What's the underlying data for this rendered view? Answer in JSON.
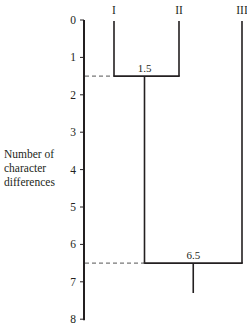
{
  "diagram": {
    "type": "dendrogram",
    "axis": {
      "label_lines": [
        "Number of",
        "character",
        "differences"
      ],
      "min": 0,
      "max": 8,
      "ticks": [
        0,
        1,
        2,
        3,
        4,
        5,
        6,
        7,
        8
      ]
    },
    "taxa": [
      {
        "id": "I",
        "label": "I"
      },
      {
        "id": "II",
        "label": "II"
      },
      {
        "id": "III",
        "label": "III"
      }
    ],
    "joins": [
      {
        "children": [
          "I",
          "II"
        ],
        "height": 1.5,
        "label": "1.5"
      },
      {
        "children": [
          "I+II",
          "III"
        ],
        "height": 6.5,
        "label": "6.5"
      }
    ],
    "root_stem_to": 7.3
  }
}
